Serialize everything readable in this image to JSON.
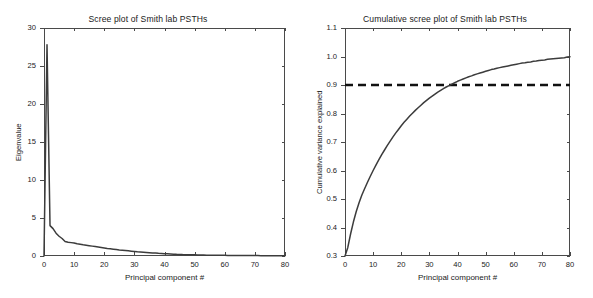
{
  "figure": {
    "background": "#ffffff",
    "line_color": "#3c3c3c",
    "axis_color": "#4a4a4a",
    "threshold_color": "#111111"
  },
  "panels": {
    "left": {
      "title": "Scree plot of Smith lab PSTHs",
      "xlabel": "Principal component #",
      "ylabel": "Eigenvalue",
      "xticks": [
        "0",
        "10",
        "20",
        "30",
        "40",
        "50",
        "60",
        "70",
        "80"
      ],
      "yticks": [
        "0",
        "5",
        "10",
        "15",
        "20",
        "25",
        "30"
      ]
    },
    "right": {
      "title": "Cumulative scree plot of Smith lab PSTHs",
      "xlabel": "Principal component #",
      "ylabel": "Cumulative variance explained",
      "xticks": [
        "0",
        "10",
        "20",
        "30",
        "40",
        "50",
        "60",
        "70",
        "80"
      ],
      "yticks": [
        "0.3",
        "0.4",
        "0.5",
        "0.6",
        "0.7",
        "0.8",
        "0.9",
        "1.0",
        "1.1"
      ]
    }
  },
  "chart_data": [
    {
      "type": "line",
      "title": "Scree plot of Smith lab PSTHs",
      "xlabel": "Principal component #",
      "ylabel": "Eigenvalue",
      "xlim": [
        0,
        80
      ],
      "ylim": [
        0,
        30
      ],
      "xticks": [
        0,
        10,
        20,
        30,
        40,
        50,
        60,
        70,
        80
      ],
      "yticks": [
        0,
        5,
        10,
        15,
        20,
        25,
        30
      ],
      "grid": false,
      "legend": "none",
      "x": [
        1,
        2,
        3,
        4,
        5,
        6,
        7,
        8,
        9,
        10,
        11,
        12,
        13,
        14,
        15,
        16,
        17,
        18,
        19,
        20,
        21,
        22,
        23,
        24,
        25,
        26,
        27,
        28,
        29,
        30,
        31,
        32,
        33,
        34,
        35,
        36,
        37,
        38,
        39,
        40,
        41,
        42,
        43,
        44,
        45,
        46,
        47,
        48,
        49,
        50,
        51,
        52,
        53,
        54,
        55,
        56,
        57,
        58,
        59,
        60,
        61,
        62,
        63,
        64,
        65,
        66,
        67,
        68,
        69,
        70,
        71,
        72,
        73,
        74,
        75,
        76,
        77,
        78,
        79,
        80
      ],
      "values": [
        27.8,
        4.0,
        3.6,
        3.0,
        2.6,
        2.3,
        1.9,
        1.82,
        1.76,
        1.7,
        1.62,
        1.55,
        1.48,
        1.42,
        1.36,
        1.3,
        1.24,
        1.18,
        1.12,
        1.06,
        1.0,
        0.95,
        0.9,
        0.85,
        0.8,
        0.76,
        0.72,
        0.68,
        0.64,
        0.6,
        0.56,
        0.53,
        0.5,
        0.47,
        0.44,
        0.41,
        0.38,
        0.35,
        0.33,
        0.3,
        0.28,
        0.26,
        0.24,
        0.22,
        0.21,
        0.19,
        0.18,
        0.17,
        0.16,
        0.15,
        0.14,
        0.13,
        0.12,
        0.115,
        0.11,
        0.105,
        0.1,
        0.095,
        0.09,
        0.085,
        0.08,
        0.077,
        0.074,
        0.071,
        0.068,
        0.065,
        0.062,
        0.059,
        0.056,
        0.053,
        0.05,
        0.048,
        0.046,
        0.044,
        0.042,
        0.04,
        0.038,
        0.036,
        0.034,
        0.032
      ]
    },
    {
      "type": "line",
      "title": "Cumulative scree plot of Smith lab PSTHs",
      "xlabel": "Principal component #",
      "ylabel": "Cumulative variance explained",
      "xlim": [
        0,
        80
      ],
      "ylim": [
        0.3,
        1.1
      ],
      "xticks": [
        0,
        10,
        20,
        30,
        40,
        50,
        60,
        70,
        80
      ],
      "yticks": [
        0.3,
        0.4,
        0.5,
        0.6,
        0.7,
        0.8,
        0.9,
        1.0,
        1.1
      ],
      "grid": false,
      "legend": "none",
      "annotations": [
        {
          "type": "hline",
          "y": 0.9,
          "style": "dashed",
          "label": "90% variance explained"
        }
      ],
      "crossing_x": 28,
      "x": [
        1,
        2,
        3,
        4,
        5,
        6,
        7,
        8,
        9,
        10,
        11,
        12,
        13,
        14,
        15,
        16,
        17,
        18,
        19,
        20,
        21,
        22,
        23,
        24,
        25,
        26,
        27,
        28,
        29,
        30,
        31,
        32,
        33,
        34,
        35,
        36,
        37,
        38,
        39,
        40,
        41,
        42,
        43,
        44,
        45,
        46,
        47,
        48,
        49,
        50,
        51,
        52,
        53,
        54,
        55,
        56,
        57,
        58,
        59,
        60,
        61,
        62,
        63,
        64,
        65,
        66,
        67,
        68,
        69,
        70,
        71,
        72,
        73,
        74,
        75,
        76,
        77,
        78,
        79,
        80
      ],
      "values": [
        0.33,
        0.378,
        0.42,
        0.456,
        0.487,
        0.514,
        0.537,
        0.559,
        0.58,
        0.6,
        0.619,
        0.637,
        0.655,
        0.671,
        0.687,
        0.702,
        0.717,
        0.731,
        0.744,
        0.757,
        0.769,
        0.78,
        0.791,
        0.801,
        0.811,
        0.82,
        0.829,
        0.838,
        0.846,
        0.854,
        0.861,
        0.868,
        0.875,
        0.881,
        0.887,
        0.893,
        0.898,
        0.903,
        0.908,
        0.913,
        0.917,
        0.921,
        0.925,
        0.929,
        0.932,
        0.936,
        0.939,
        0.942,
        0.945,
        0.948,
        0.951,
        0.954,
        0.956,
        0.959,
        0.961,
        0.963,
        0.965,
        0.967,
        0.969,
        0.971,
        0.973,
        0.975,
        0.977,
        0.978,
        0.98,
        0.981,
        0.983,
        0.984,
        0.986,
        0.987,
        0.988,
        0.99,
        0.991,
        0.992,
        0.993,
        0.994,
        0.995,
        0.996,
        0.998,
        0.999
      ]
    }
  ]
}
